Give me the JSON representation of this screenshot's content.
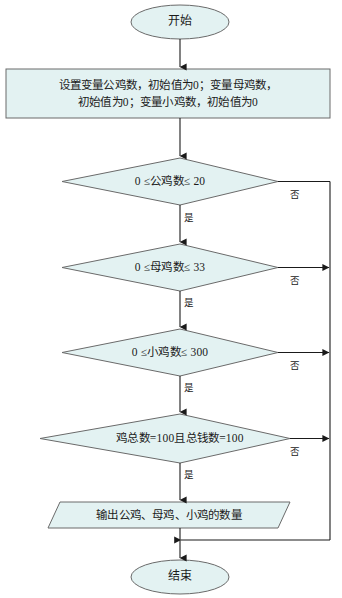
{
  "diagram": {
    "colors": {
      "shape_fill": "#e3f2f2",
      "shape_stroke": "#6a6a6a",
      "line": "#1a1a1a",
      "text": "#1b1b1b",
      "background": "#ffffff"
    }
  },
  "nodes": {
    "start": {
      "shape": "terminal-oval",
      "label": "开始"
    },
    "init": {
      "shape": "process-rect",
      "line1": "设置变量公鸡数，初始值为0；变量母鸡数，",
      "line2": "初始值为0；变量小鸡数，初始值为0"
    },
    "cond_rooster": {
      "shape": "decision-diamond",
      "label": "0 ≤公鸡数≤ 20"
    },
    "cond_hen": {
      "shape": "decision-diamond",
      "label": "0 ≤母鸡数≤ 33"
    },
    "cond_chick": {
      "shape": "decision-diamond",
      "label": "0 ≤小鸡数≤ 300"
    },
    "cond_total": {
      "shape": "decision-diamond",
      "label": "鸡总数=100且总钱数=100"
    },
    "output": {
      "shape": "io-parallelogram",
      "label": "输出公鸡、母鸡、小鸡的数量"
    },
    "end": {
      "shape": "terminal-oval",
      "label": "结束"
    }
  },
  "edges": {
    "yes_rooster": "是",
    "no_rooster": "否",
    "yes_hen": "是",
    "no_hen": "否",
    "yes_chick": "是",
    "no_chick": "否",
    "yes_total": "是",
    "no_total": "否"
  }
}
